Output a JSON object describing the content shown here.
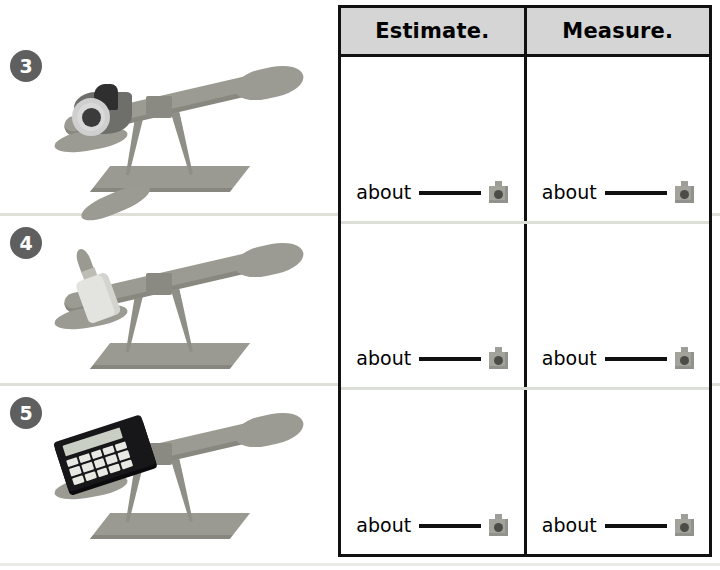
{
  "page": {
    "instruction": "Then measure.",
    "background_color": "#ffffff"
  },
  "table": {
    "border_color": "#111111",
    "header_background": "#d5d5d5",
    "headers": [
      {
        "label": "Estimate."
      },
      {
        "label": "Measure."
      }
    ],
    "answer_prefix": "about",
    "unit_icon": "unit-cube-icon"
  },
  "problems": [
    {
      "number": "3",
      "object": "tape-dispenser",
      "illustration": "balance-scale-with-tape-dispenser",
      "estimate": {
        "prefix": "about",
        "value": "",
        "unit_icon": "unit-cube-icon"
      },
      "measure": {
        "prefix": "about",
        "value": "",
        "unit_icon": "unit-cube-icon"
      }
    },
    {
      "number": "4",
      "object": "glue-bottle",
      "illustration": "balance-scale-with-glue-bottle",
      "estimate": {
        "prefix": "about",
        "value": "",
        "unit_icon": "unit-cube-icon"
      },
      "measure": {
        "prefix": "about",
        "value": "",
        "unit_icon": "unit-cube-icon"
      }
    },
    {
      "number": "5",
      "object": "calculator",
      "illustration": "balance-scale-with-calculator",
      "estimate": {
        "prefix": "about",
        "value": "",
        "unit_icon": "unit-cube-icon"
      },
      "measure": {
        "prefix": "about",
        "value": "",
        "unit_icon": "unit-cube-icon"
      }
    }
  ]
}
